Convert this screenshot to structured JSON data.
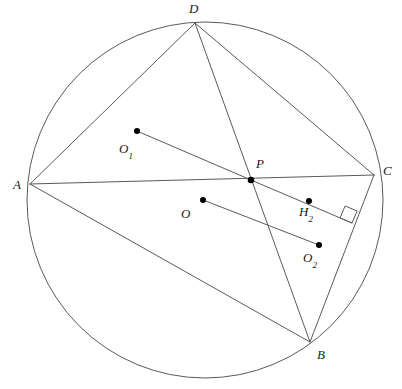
{
  "figure": {
    "kind": "euclidean-geometry-diagram",
    "width": 402,
    "height": 389,
    "background_color": "#ffffff",
    "stroke_color": "#5a5a5a",
    "point_color": "#000000",
    "label_color": "#1a1a1a"
  },
  "circle": {
    "name": "circumcircle",
    "center_x": 205,
    "center_y": 200,
    "radius": 178
  },
  "points": [
    {
      "id": "A",
      "label": "A",
      "sub": "",
      "x": 30,
      "y": 184,
      "label_x": 13,
      "label_y": 178,
      "dot": false
    },
    {
      "id": "B",
      "label": "B",
      "sub": "",
      "x": 310,
      "y": 342,
      "label_x": 317,
      "label_y": 348,
      "dot": false
    },
    {
      "id": "C",
      "label": "C",
      "sub": "",
      "x": 374,
      "y": 175,
      "label_x": 383,
      "label_y": 164,
      "dot": false
    },
    {
      "id": "D",
      "label": "D",
      "sub": "",
      "x": 195,
      "y": 23,
      "label_x": 189,
      "label_y": 2,
      "dot": false
    },
    {
      "id": "P",
      "label": "P",
      "sub": "",
      "x": 251,
      "y": 180,
      "label_x": 256,
      "label_y": 157,
      "dot": true
    },
    {
      "id": "O",
      "label": "O",
      "sub": "",
      "x": 203,
      "y": 200,
      "label_x": 181,
      "label_y": 207,
      "dot": true
    },
    {
      "id": "O1",
      "label": "O",
      "sub": "1",
      "x": 137,
      "y": 131,
      "label_x": 119,
      "label_y": 142,
      "dot": true
    },
    {
      "id": "O2",
      "label": "O",
      "sub": "2",
      "x": 319,
      "y": 245,
      "label_x": 303,
      "label_y": 251,
      "dot": true
    },
    {
      "id": "H2",
      "label": "H",
      "sub": "2",
      "x": 309,
      "y": 201,
      "label_x": 299,
      "label_y": 205,
      "dot": true
    }
  ],
  "segments": [
    {
      "name": "AD",
      "from": "A",
      "to": "D"
    },
    {
      "name": "AC",
      "from": "A",
      "to": "C"
    },
    {
      "name": "AB",
      "from": "A",
      "to": "B"
    },
    {
      "name": "DC",
      "from": "D",
      "to": "C"
    },
    {
      "name": "DB",
      "from": "D",
      "to": "B"
    },
    {
      "name": "CB",
      "from": "C",
      "to": "B"
    },
    {
      "name": "O1P",
      "from": "O1",
      "to": "P"
    },
    {
      "name": "OO2",
      "from": "O",
      "to": "O2"
    },
    {
      "name": "PK",
      "from": "P",
      "to": "K"
    }
  ],
  "extra_points": [
    {
      "id": "K",
      "x": 352,
      "y": 223
    }
  ],
  "right_angle": {
    "name": "right-angle-mark",
    "vertex_x": 352,
    "vertex_y": 223,
    "size": 13,
    "label": "right angle"
  }
}
